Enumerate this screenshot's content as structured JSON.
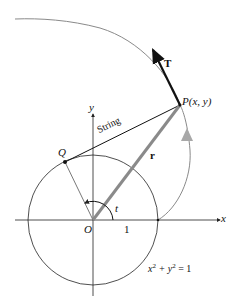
{
  "diagram": {
    "labels": {
      "tangent_vector": "T",
      "point_p": "P(x, y)",
      "string": "String",
      "point_q": "Q",
      "position_vector": "r",
      "y_axis": "y",
      "x_axis": "x",
      "origin": "O",
      "angle": "t",
      "unit_tick": "1",
      "equation_lhs": "x",
      "equation_exp1": "2",
      "equation_mid": " + y",
      "equation_exp2": "2",
      "equation_rhs": " = 1"
    },
    "colors": {
      "axis": "#222222",
      "circle": "#222222",
      "involute": "#8a8a8a",
      "radius_vector": "#8a8a8a",
      "tangent": "#111111",
      "motion_arrow": "#bdbdbd"
    }
  }
}
